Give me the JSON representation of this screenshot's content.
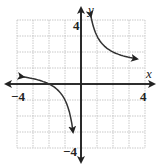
{
  "chart_data": {
    "type": "line",
    "title": "",
    "xlabel": "x",
    "ylabel": "y",
    "xlim": [
      -4,
      4
    ],
    "ylim": [
      -4,
      4
    ],
    "grid": true,
    "tick_labels": {
      "x_min": "−4",
      "x_max": "4",
      "y_min": "−4",
      "y_max": "4"
    },
    "series": [
      {
        "name": "upper-branch",
        "x": [
          0.6,
          0.8,
          1.0,
          1.5,
          2.0,
          2.5,
          3.0,
          3.5
        ],
        "y": [
          4.33,
          3.5,
          3.0,
          2.33,
          2.0,
          1.8,
          1.67,
          1.57
        ]
      },
      {
        "name": "lower-branch",
        "x": [
          -3.6,
          -3.0,
          -2.5,
          -2.0,
          -1.5,
          -1.0,
          -0.8,
          -0.6,
          -0.5
        ],
        "y": [
          0.44,
          0.33,
          0.2,
          0.0,
          -0.33,
          -1.0,
          -1.5,
          -2.33,
          -3.0
        ]
      }
    ],
    "annotations": [
      "Hyperbola with asymptotes x = 0 and y = 1"
    ]
  },
  "colors": {
    "curve": "#333333",
    "axis": "#222222",
    "grid": "#bbbbbb"
  }
}
